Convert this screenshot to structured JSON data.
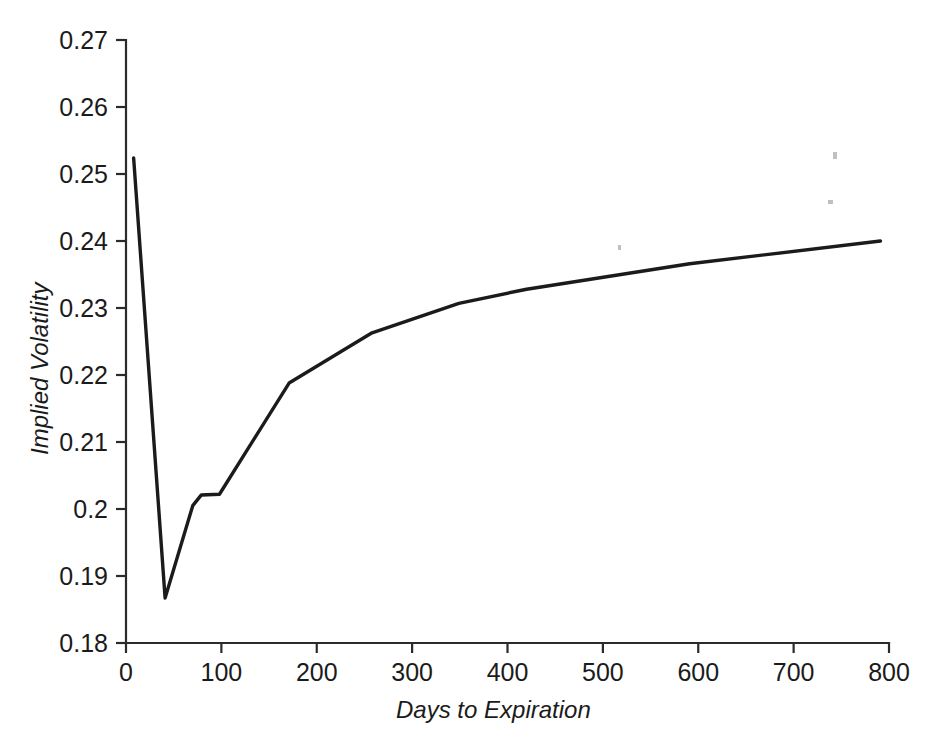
{
  "chart_data": {
    "type": "line",
    "title": "",
    "xlabel": "Days to Expiration",
    "ylabel": "Implied Volatility",
    "xlim": [
      0,
      800
    ],
    "ylim": [
      0.18,
      0.27
    ],
    "xticks": [
      0,
      100,
      200,
      300,
      400,
      500,
      600,
      700,
      800
    ],
    "xtick_labels": [
      "0",
      "100",
      "200",
      "300",
      "400",
      "500",
      "600",
      "700",
      "800"
    ],
    "yticks": [
      0.18,
      0.19,
      0.2,
      0.21,
      0.22,
      0.23,
      0.24,
      0.25,
      0.26,
      0.27
    ],
    "ytick_labels": [
      "0.18",
      "0.19",
      "0.2",
      "0.21",
      "0.22",
      "0.23",
      "0.24",
      "0.25",
      "0.26",
      "0.27"
    ],
    "grid": false,
    "legend": false,
    "line_color": "#1b1b1b",
    "series": [
      {
        "name": "Implied Volatility Term Structure",
        "x": [
          8,
          41,
          70,
          79,
          98,
          171,
          258,
          349,
          420,
          591,
          791
        ],
        "y": [
          0.2524,
          0.1867,
          0.2005,
          0.2021,
          0.2022,
          0.2188,
          0.2263,
          0.2307,
          0.2328,
          0.2366,
          0.24
        ]
      }
    ],
    "annotations": []
  },
  "axes": {
    "x_title": "Days to Expiration",
    "y_title": "Implied Volatility"
  },
  "marks": {
    "specks": [
      {
        "x": 618,
        "y": 245,
        "w": 3,
        "h": 5
      },
      {
        "x": 833,
        "y": 152,
        "w": 4,
        "h": 7
      },
      {
        "x": 828,
        "y": 200,
        "w": 5,
        "h": 4
      }
    ]
  }
}
